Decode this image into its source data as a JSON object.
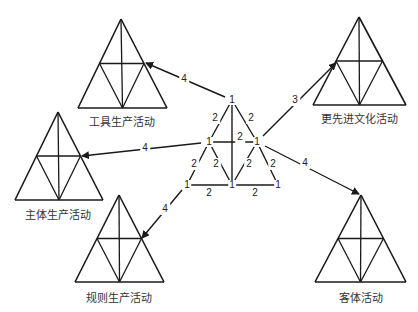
{
  "colors": {
    "line": "#1a1a1a",
    "text": "#222222",
    "background": "#ffffff"
  },
  "triangles": [
    {
      "id": "tool",
      "label": "工具生产活动",
      "apex": [
        121,
        19
      ],
      "left": [
        78,
        108
      ],
      "right": [
        167,
        108
      ],
      "label_pos": [
        122,
        113
      ]
    },
    {
      "id": "culture",
      "label": "更先进文化活动",
      "apex": [
        359,
        17
      ],
      "left": [
        313,
        105
      ],
      "right": [
        406,
        105
      ],
      "label_pos": [
        359,
        110
      ]
    },
    {
      "id": "subject",
      "label": "主体生产活动",
      "apex": [
        58,
        112
      ],
      "left": [
        15,
        200
      ],
      "right": [
        103,
        200
      ],
      "label_pos": [
        58,
        206
      ]
    },
    {
      "id": "rule",
      "label": "规则生产活动",
      "apex": [
        119,
        195
      ],
      "left": [
        75,
        282
      ],
      "right": [
        164,
        282
      ],
      "label_pos": [
        119,
        289
      ]
    },
    {
      "id": "object",
      "label": "客体活动",
      "apex": [
        361,
        195
      ],
      "left": [
        315,
        282
      ],
      "right": [
        406,
        282
      ],
      "label_pos": [
        361,
        289
      ]
    }
  ],
  "network": {
    "nodes": [
      {
        "id": "top",
        "label": "1",
        "pos": [
          232,
          100
        ]
      },
      {
        "id": "mid_left",
        "label": "1",
        "pos": [
          209,
          142
        ]
      },
      {
        "id": "mid_right",
        "label": "1",
        "pos": [
          257,
          142
        ]
      },
      {
        "id": "bot_left",
        "label": "1",
        "pos": [
          187,
          185
        ]
      },
      {
        "id": "bot_mid",
        "label": "1",
        "pos": [
          232,
          185
        ]
      },
      {
        "id": "bot_right",
        "label": "1",
        "pos": [
          278,
          185
        ]
      }
    ],
    "edges": [
      {
        "from": "top",
        "to": "mid_left",
        "label": "2",
        "label_pos": [
          215,
          118
        ]
      },
      {
        "from": "top",
        "to": "mid_right",
        "label": "2",
        "label_pos": [
          251,
          118
        ]
      },
      {
        "from": "top",
        "to": "bot_mid",
        "label": "",
        "label_pos": null
      },
      {
        "from": "mid_left",
        "to": "mid_right",
        "label": "2",
        "label_pos": [
          240,
          137
        ]
      },
      {
        "from": "mid_left",
        "to": "bot_left",
        "label": "2",
        "label_pos": [
          194,
          164
        ]
      },
      {
        "from": "mid_left",
        "to": "bot_mid",
        "label": "2",
        "label_pos": [
          216,
          164
        ]
      },
      {
        "from": "mid_right",
        "to": "bot_mid",
        "label": "2",
        "label_pos": [
          249,
          164
        ]
      },
      {
        "from": "mid_right",
        "to": "bot_right",
        "label": "2",
        "label_pos": [
          273,
          164
        ]
      },
      {
        "from": "bot_left",
        "to": "bot_mid",
        "label": "2",
        "label_pos": [
          209,
          193
        ]
      },
      {
        "from": "bot_mid",
        "to": "bot_right",
        "label": "2",
        "label_pos": [
          255,
          193
        ]
      }
    ]
  },
  "arrows": [
    {
      "from": "top",
      "to_triangle": "tool",
      "label": "4",
      "start": [
        225,
        97
      ],
      "end": [
        146,
        63
      ],
      "label_pos": [
        184,
        79
      ]
    },
    {
      "from": "mid_left",
      "to_triangle": "subject",
      "label": "4",
      "start": [
        201,
        143
      ],
      "end": [
        82,
        156
      ],
      "label_pos": [
        145,
        148
      ]
    },
    {
      "from": "mid_right",
      "to_triangle": "culture",
      "label": "3",
      "start": [
        263,
        136
      ],
      "end": [
        336,
        63
      ],
      "label_pos": [
        295,
        100
      ]
    },
    {
      "from": "mid_right",
      "to_triangle": "object",
      "label": "4",
      "start": [
        265,
        146
      ],
      "end": [
        359,
        194
      ],
      "label_pos": [
        305,
        163
      ]
    },
    {
      "from": "bot_left",
      "to_triangle": "rule",
      "label": "4",
      "start": [
        182,
        190
      ],
      "end": [
        142,
        238
      ],
      "label_pos": [
        165,
        209
      ]
    }
  ]
}
